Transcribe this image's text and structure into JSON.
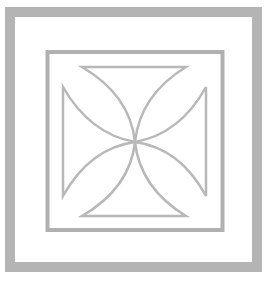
{
  "image": {
    "subject": "cross-pattee-emblem",
    "colors": {
      "background": "#ffffff",
      "outer_frame": "#b4b4b4",
      "inner_frame": "#b0b0b0",
      "cross_stroke": "#b8b8b8"
    }
  }
}
